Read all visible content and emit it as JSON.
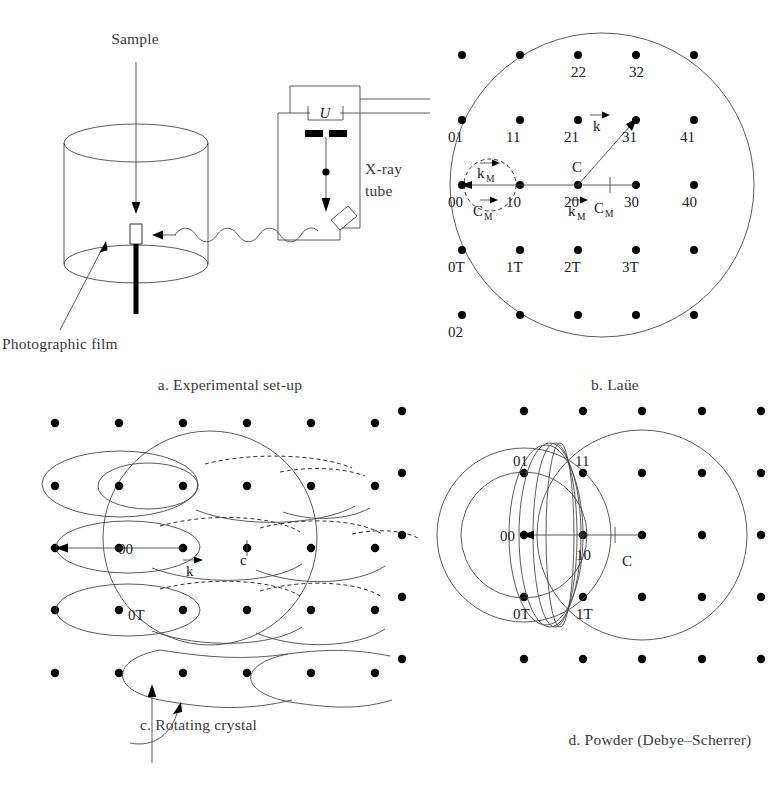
{
  "figure": {
    "panels": [
      "a. Experimental set-up",
      "b. Laüe",
      "c. Rotating crystal",
      "d. Powder (Debye–Scherrer)"
    ]
  },
  "panel_a": {
    "caption": "a. Experimental set-up",
    "labels": {
      "sample": "Sample",
      "film": "Photographic film",
      "tube_line1": "X-ray",
      "tube_line2": "tube",
      "voltage": "U"
    }
  },
  "panel_b": {
    "caption": "b. Laüe",
    "lattice_labels": [
      {
        "text": "01",
        "row": 1,
        "col": 0
      },
      {
        "text": "11",
        "row": 1,
        "col": 1
      },
      {
        "text": "21",
        "row": 1,
        "col": 2
      },
      {
        "text": "31",
        "row": 1,
        "col": 3
      },
      {
        "text": "41",
        "row": 1,
        "col": 4
      },
      {
        "text": "22",
        "row": 2,
        "col": 2
      },
      {
        "text": "32",
        "row": 2,
        "col": 3
      },
      {
        "text": "00",
        "row": 0,
        "col": 0
      },
      {
        "text": "10",
        "row": 0,
        "col": 1
      },
      {
        "text": "20",
        "row": 0,
        "col": 2
      },
      {
        "text": "30",
        "row": 0,
        "col": 3
      },
      {
        "text": "40",
        "row": 0,
        "col": 4
      },
      {
        "text": "0T",
        "row": -1,
        "col": 0
      },
      {
        "text": "1T",
        "row": -1,
        "col": 1
      },
      {
        "text": "2T",
        "row": -1,
        "col": 2
      },
      {
        "text": "3T",
        "row": -1,
        "col": 3
      },
      {
        "text": "02",
        "row": -2,
        "col": 0
      }
    ],
    "vector_labels": {
      "centre": "C",
      "k": "k",
      "k_m": "k",
      "k_m_sub": "M",
      "c_m": "C",
      "c_m_sub": "M"
    }
  },
  "panel_c": {
    "caption": "c. Rotating crystal",
    "labels": {
      "origin": "00",
      "row_below": "0T",
      "k": "k",
      "centre": "c"
    }
  },
  "panel_d": {
    "caption": "d. Powder (Debye–Scherrer)",
    "labels": {
      "l01": "01",
      "l11": "11",
      "l00": "00",
      "l10": "10",
      "l0T": "0T",
      "l1T": "1T",
      "centre": "C"
    }
  },
  "colors": {
    "ink": "#222222",
    "line": "#333333",
    "background": "#ffffff"
  }
}
